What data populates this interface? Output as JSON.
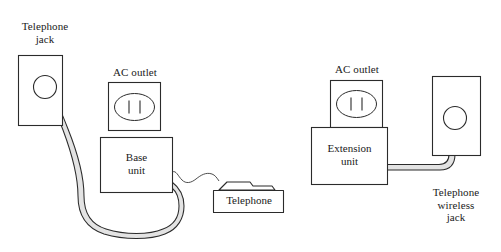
{
  "figure": {
    "background_color": "#ffffff",
    "line_color": "#2b2b2b",
    "cable_fill_color": "#e3e3e3",
    "text_color": "#1a1a1a"
  },
  "labels": {
    "telephone_jack": "Telephone\njack",
    "ac_outlet_left": "AC outlet",
    "base_unit": "Base\nunit",
    "telephone": "Telephone",
    "ac_outlet_right": "AC outlet",
    "extension_unit": "Extension\nunit",
    "telephone_wireless_jack": "Telephone\nwireless\njack"
  },
  "components": [
    {
      "id": "telephone-jack",
      "label": "Telephone jack",
      "shape": "wall-plate-with-port"
    },
    {
      "id": "ac-outlet-left",
      "label": "AC outlet",
      "shape": "outlet-plate",
      "slots": 2
    },
    {
      "id": "base-unit",
      "label": "Base unit",
      "shape": "box"
    },
    {
      "id": "telephone",
      "label": "Telephone",
      "shape": "handset-on-base"
    },
    {
      "id": "ac-outlet-right",
      "label": "AC outlet",
      "shape": "outlet-plate",
      "slots": 2
    },
    {
      "id": "extension-unit",
      "label": "Extension unit",
      "shape": "box"
    },
    {
      "id": "telephone-wireless-jack",
      "label": "Telephone wireless jack",
      "shape": "wall-plate-with-port"
    }
  ],
  "connections": [
    {
      "from": "telephone-jack",
      "to": "base-unit",
      "style": "thick-cable"
    },
    {
      "from": "ac-outlet-left",
      "to": "base-unit",
      "style": "plugged-in"
    },
    {
      "from": "base-unit",
      "to": "telephone",
      "style": "thin-cord"
    },
    {
      "from": "ac-outlet-right",
      "to": "extension-unit",
      "style": "plugged-in"
    },
    {
      "from": "extension-unit",
      "to": "telephone-wireless-jack",
      "style": "thick-cable"
    }
  ]
}
